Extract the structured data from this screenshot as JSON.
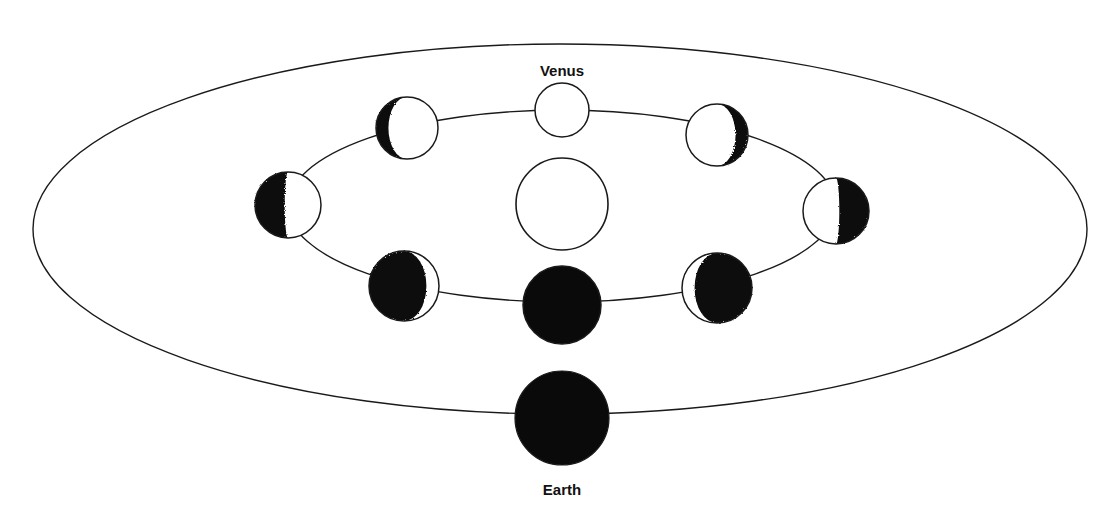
{
  "diagram": {
    "labels": {
      "venus": "Venus",
      "earth": "Earth"
    },
    "colors": {
      "line": "#1a1a1a",
      "dark": "#0a0a0a",
      "light": "#ffffff",
      "background": "#ffffff"
    },
    "orbits": {
      "earth_orbit": {
        "cx": 560,
        "cy": 229,
        "rx": 527,
        "ry": 185
      },
      "venus_orbit": {
        "cx": 562,
        "cy": 206,
        "rx": 274,
        "ry": 96
      }
    },
    "sun": {
      "name": "Sun",
      "cx": 562,
      "cy": 204,
      "r": 46
    },
    "earth": {
      "name": "Earth",
      "cx": 562,
      "cy": 418,
      "r": 47
    },
    "venus_phases": [
      {
        "id": "full",
        "position": "top",
        "phase": "full",
        "cx": 562,
        "cy": 110,
        "r": 27,
        "dark_side": "none",
        "lit_fraction": 1.0
      },
      {
        "id": "upper-left",
        "position": "upper-left",
        "phase": "waning-gibbous",
        "cx": 407,
        "cy": 128,
        "r": 31,
        "dark_side": "left",
        "lit_fraction": 0.8
      },
      {
        "id": "upper-right",
        "position": "upper-right",
        "phase": "waxing-gibbous",
        "cx": 717,
        "cy": 135,
        "r": 31,
        "dark_side": "right",
        "lit_fraction": 0.8
      },
      {
        "id": "left",
        "position": "left",
        "phase": "quarter",
        "cx": 288,
        "cy": 205,
        "r": 33,
        "dark_side": "left",
        "lit_fraction": 0.55
      },
      {
        "id": "right",
        "position": "right",
        "phase": "quarter",
        "cx": 836,
        "cy": 211,
        "r": 33,
        "dark_side": "right",
        "lit_fraction": 0.55
      },
      {
        "id": "lower-left",
        "position": "lower-left",
        "phase": "crescent",
        "cx": 404,
        "cy": 286,
        "r": 35,
        "dark_side": "left",
        "lit_fraction": 0.18
      },
      {
        "id": "lower-right",
        "position": "lower-right",
        "phase": "crescent",
        "cx": 717,
        "cy": 288,
        "r": 35,
        "dark_side": "right",
        "lit_fraction": 0.18
      },
      {
        "id": "new",
        "position": "bottom",
        "phase": "new",
        "cx": 562,
        "cy": 305,
        "r": 39,
        "dark_side": "all",
        "lit_fraction": 0.0
      }
    ],
    "label_positions": {
      "venus": {
        "x": 562,
        "y": 62
      },
      "earth": {
        "x": 562,
        "y": 481
      }
    }
  }
}
